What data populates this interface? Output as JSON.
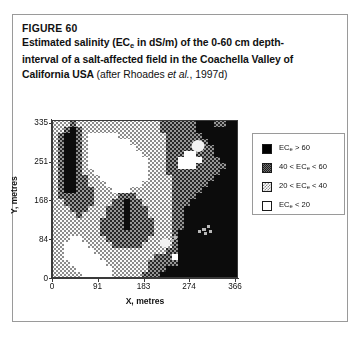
{
  "figure": {
    "label": "FIGURE 60",
    "caption_line_1": "Estimated salinity (EC",
    "caption_sub_1": "e",
    "caption_line_1b": " in dS/m) of the 0-60 cm depth-",
    "caption_line_2": "interval of a salt-affected field in the Coachella Valley of",
    "caption_line_3a": "California USA ",
    "caption_line_3b": "(after Rhoades ",
    "caption_line_3_italic": "et al.",
    "caption_line_3c": ", 1997d)"
  },
  "axes": {
    "x_title": "X, metres",
    "y_title": "Y, metres",
    "x_ticks": [
      "0",
      "91",
      "183",
      "274",
      "366"
    ],
    "x_tick_values": [
      0,
      91,
      183,
      274,
      366
    ],
    "y_ticks": [
      "0",
      "84",
      "168",
      "251",
      "335"
    ],
    "y_tick_values": [
      0,
      84,
      168,
      251,
      335
    ],
    "x_min": 0,
    "x_max": 372,
    "y_min": 0,
    "y_max": 341
  },
  "legend": {
    "items": [
      {
        "name": "ec-above-60",
        "pattern": "solid-black",
        "prefix": "EC",
        "sub": "e",
        "suffix": " > 60",
        "color": "#000000"
      },
      {
        "name": "ec-40-60",
        "pattern": "dark-checker",
        "prefix": "40 < EC",
        "sub": "e",
        "suffix": " < 60",
        "color": "#6f6f6f"
      },
      {
        "name": "ec-20-40",
        "pattern": "light-stipple",
        "prefix": "20 < EC",
        "sub": "e",
        "suffix": " < 40",
        "color": "#c9c9c9"
      },
      {
        "name": "ec-below-20",
        "pattern": "white",
        "prefix": "EC",
        "sub": "e",
        "suffix": " < 20",
        "color": "#ffffff"
      }
    ]
  },
  "chart_data": {
    "type": "heatmap",
    "xlabel": "X, metres",
    "ylabel": "Y, metres",
    "xlim": [
      0,
      372
    ],
    "ylim": [
      0,
      341
    ],
    "grid": false,
    "legend_position": "right",
    "class_labels": [
      "ECe < 20",
      "20 < ECe < 40",
      "40 < ECe < 60",
      "ECe > 60"
    ],
    "class_colors": [
      "#ffffff",
      "#c9c9c9",
      "#6f6f6f",
      "#000000"
    ],
    "grid_cols": 31,
    "grid_rows": 26,
    "grid_note": "Class index per cell: 0 = ECe<20, 1 = 20-40, 2 = 40-60, 3 = ECe>60. Row 0 is the top (Y=335), row 25 is the bottom (Y=0).",
    "grid_values": [
      [
        1,
        1,
        1,
        2,
        1,
        1,
        1,
        1,
        1,
        1,
        1,
        1,
        1,
        1,
        1,
        1,
        1,
        1,
        2,
        2,
        2,
        2,
        2,
        2,
        3,
        3,
        3,
        2,
        2,
        3,
        3
      ],
      [
        1,
        1,
        2,
        3,
        2,
        1,
        1,
        1,
        1,
        1,
        1,
        1,
        1,
        1,
        1,
        1,
        1,
        1,
        2,
        2,
        2,
        2,
        2,
        2,
        3,
        3,
        3,
        3,
        3,
        3,
        3
      ],
      [
        1,
        2,
        3,
        3,
        2,
        1,
        0,
        0,
        0,
        0,
        0,
        1,
        1,
        1,
        1,
        1,
        1,
        1,
        1,
        2,
        2,
        2,
        2,
        2,
        2,
        3,
        3,
        3,
        3,
        3,
        3
      ],
      [
        1,
        2,
        3,
        3,
        2,
        1,
        0,
        0,
        0,
        0,
        0,
        0,
        0,
        1,
        1,
        1,
        1,
        1,
        1,
        2,
        2,
        2,
        2,
        2,
        2,
        2,
        3,
        3,
        3,
        3,
        3
      ],
      [
        1,
        2,
        3,
        3,
        2,
        1,
        0,
        0,
        0,
        0,
        0,
        0,
        0,
        0,
        1,
        1,
        1,
        1,
        1,
        2,
        2,
        2,
        2,
        2,
        2,
        2,
        2,
        3,
        3,
        3,
        3
      ],
      [
        1,
        2,
        3,
        3,
        2,
        1,
        0,
        0,
        0,
        0,
        0,
        0,
        0,
        0,
        0,
        1,
        1,
        1,
        1,
        2,
        2,
        2,
        0,
        0,
        2,
        2,
        2,
        3,
        3,
        3,
        3
      ],
      [
        1,
        2,
        3,
        3,
        2,
        1,
        0,
        0,
        0,
        0,
        0,
        0,
        0,
        0,
        0,
        0,
        1,
        1,
        1,
        2,
        2,
        0,
        0,
        0,
        0,
        2,
        2,
        2,
        3,
        3,
        3
      ],
      [
        1,
        2,
        3,
        3,
        2,
        1,
        0,
        0,
        0,
        0,
        0,
        0,
        0,
        0,
        0,
        0,
        1,
        1,
        1,
        2,
        2,
        0,
        0,
        0,
        2,
        2,
        2,
        2,
        2,
        3,
        3
      ],
      [
        1,
        2,
        3,
        3,
        2,
        1,
        1,
        0,
        0,
        0,
        0,
        0,
        0,
        0,
        0,
        0,
        1,
        1,
        1,
        2,
        2,
        2,
        2,
        2,
        2,
        2,
        2,
        2,
        3,
        3,
        3
      ],
      [
        1,
        2,
        3,
        3,
        2,
        2,
        1,
        1,
        0,
        0,
        0,
        0,
        0,
        0,
        0,
        0,
        1,
        1,
        1,
        1,
        2,
        2,
        2,
        2,
        2,
        2,
        2,
        3,
        3,
        3,
        3
      ],
      [
        1,
        2,
        3,
        3,
        2,
        2,
        1,
        1,
        1,
        0,
        0,
        0,
        0,
        0,
        0,
        1,
        1,
        1,
        1,
        1,
        2,
        2,
        2,
        2,
        2,
        2,
        3,
        3,
        3,
        3,
        3
      ],
      [
        1,
        2,
        3,
        3,
        2,
        2,
        2,
        1,
        1,
        1,
        0,
        0,
        0,
        1,
        1,
        1,
        1,
        1,
        1,
        1,
        2,
        2,
        2,
        2,
        2,
        3,
        3,
        3,
        3,
        3,
        3
      ],
      [
        1,
        2,
        2,
        2,
        2,
        2,
        2,
        1,
        1,
        1,
        1,
        2,
        2,
        2,
        1,
        1,
        1,
        1,
        1,
        1,
        2,
        2,
        2,
        2,
        3,
        3,
        3,
        3,
        3,
        3,
        3
      ],
      [
        1,
        1,
        2,
        2,
        2,
        2,
        2,
        1,
        1,
        1,
        2,
        2,
        3,
        2,
        2,
        1,
        1,
        1,
        1,
        1,
        2,
        2,
        2,
        3,
        3,
        3,
        3,
        3,
        3,
        3,
        3
      ],
      [
        1,
        1,
        1,
        2,
        2,
        2,
        1,
        1,
        1,
        2,
        2,
        2,
        3,
        2,
        2,
        2,
        1,
        1,
        1,
        1,
        2,
        2,
        3,
        3,
        3,
        3,
        3,
        3,
        3,
        3,
        3
      ],
      [
        1,
        1,
        1,
        1,
        2,
        1,
        1,
        1,
        1,
        2,
        2,
        2,
        3,
        2,
        2,
        2,
        1,
        1,
        1,
        1,
        2,
        2,
        3,
        3,
        3,
        3,
        3,
        3,
        3,
        3,
        3
      ],
      [
        1,
        1,
        1,
        1,
        1,
        1,
        1,
        1,
        2,
        2,
        2,
        2,
        3,
        2,
        2,
        2,
        2,
        1,
        1,
        1,
        2,
        2,
        3,
        3,
        3,
        3,
        3,
        3,
        3,
        3,
        3
      ],
      [
        1,
        1,
        1,
        1,
        1,
        1,
        1,
        1,
        2,
        2,
        2,
        2,
        3,
        2,
        2,
        2,
        2,
        1,
        1,
        1,
        2,
        2,
        3,
        3,
        3,
        3,
        3,
        3,
        3,
        3,
        3
      ],
      [
        1,
        1,
        1,
        1,
        1,
        1,
        1,
        1,
        2,
        2,
        2,
        2,
        2,
        2,
        2,
        2,
        2,
        1,
        1,
        1,
        2,
        3,
        3,
        3,
        3,
        3,
        3,
        3,
        3,
        3,
        3
      ],
      [
        1,
        1,
        1,
        0,
        0,
        1,
        1,
        1,
        1,
        2,
        2,
        2,
        2,
        2,
        2,
        2,
        1,
        1,
        1,
        1,
        2,
        3,
        3,
        3,
        3,
        3,
        3,
        3,
        3,
        3,
        3
      ],
      [
        1,
        1,
        0,
        0,
        0,
        0,
        1,
        1,
        1,
        1,
        2,
        2,
        2,
        2,
        2,
        1,
        1,
        1,
        1,
        1,
        2,
        3,
        3,
        3,
        3,
        3,
        3,
        3,
        3,
        3,
        3
      ],
      [
        1,
        1,
        0,
        0,
        0,
        0,
        0,
        1,
        1,
        1,
        1,
        1,
        1,
        1,
        1,
        1,
        1,
        1,
        1,
        2,
        2,
        3,
        3,
        3,
        3,
        3,
        3,
        3,
        3,
        3,
        3
      ],
      [
        1,
        1,
        0,
        0,
        0,
        0,
        0,
        0,
        1,
        1,
        1,
        1,
        1,
        1,
        1,
        1,
        1,
        2,
        2,
        2,
        0,
        3,
        3,
        3,
        3,
        3,
        3,
        3,
        3,
        3,
        3
      ],
      [
        1,
        1,
        1,
        0,
        0,
        0,
        0,
        0,
        0,
        1,
        1,
        1,
        1,
        1,
        1,
        1,
        2,
        2,
        2,
        2,
        2,
        3,
        3,
        3,
        3,
        3,
        3,
        3,
        3,
        3,
        3
      ],
      [
        1,
        1,
        1,
        1,
        0,
        0,
        0,
        0,
        0,
        0,
        1,
        1,
        1,
        1,
        1,
        1,
        2,
        2,
        2,
        3,
        3,
        3,
        3,
        3,
        3,
        3,
        3,
        3,
        3,
        3,
        3
      ],
      [
        1,
        1,
        1,
        1,
        1,
        0,
        0,
        0,
        0,
        0,
        1,
        1,
        1,
        1,
        1,
        2,
        2,
        2,
        3,
        3,
        3,
        3,
        3,
        3,
        3,
        3,
        3,
        3,
        3,
        3,
        3
      ]
    ]
  }
}
